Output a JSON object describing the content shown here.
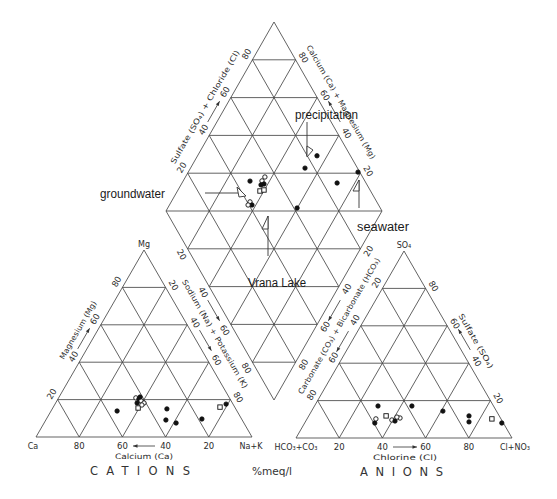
{
  "chart_data": {
    "type": "scatter",
    "variant": "piper-trilinear",
    "title": "",
    "units_label": "%meq/l",
    "grid": true,
    "grid_interval_percent": 20,
    "marker_types": [
      "filled",
      "open-circle",
      "open-square"
    ],
    "cations": {
      "title": "CATIONS",
      "vertex_labels": {
        "bottom_left": "Ca",
        "bottom_right": "Na+K",
        "top": "Mg"
      },
      "axes": {
        "calcium": {
          "label": "Calcium (Ca)",
          "ticks": [
            "80",
            "60",
            "40",
            "20"
          ]
        },
        "magnesium": {
          "label": "Magnesium (Mg)",
          "ticks": [
            "20",
            "40",
            "60",
            "80"
          ]
        },
        "sodium_potassium": {
          "label": "Sodium (Na) + Potassium (K)",
          "ticks": [
            "20",
            "40",
            "60",
            "80"
          ]
        }
      },
      "points": [
        {
          "ca": 43.3,
          "mg": 20.9,
          "nak": 35.8,
          "marker": "open-circle"
        },
        {
          "ca": 42.2,
          "mg": 20.3,
          "nak": 37.5,
          "marker": "filled"
        },
        {
          "ca": 41.7,
          "mg": 19.3,
          "nak": 39.0,
          "marker": "open-circle"
        },
        {
          "ca": 40.9,
          "mg": 18.2,
          "nak": 40.9,
          "marker": "open-circle"
        },
        {
          "ca": 44.1,
          "mg": 18.2,
          "nak": 37.7,
          "marker": "filled"
        },
        {
          "ca": 41.1,
          "mg": 21.4,
          "nak": 37.5,
          "marker": "filled"
        },
        {
          "ca": 45.0,
          "mg": 15.5,
          "nak": 39.5,
          "marker": "open-square"
        },
        {
          "ca": 42.4,
          "mg": 17.1,
          "nak": 40.5,
          "marker": "open-circle"
        },
        {
          "ca": 55.5,
          "mg": 13.9,
          "nak": 30.6,
          "marker": "filled"
        },
        {
          "ca": 31.9,
          "mg": 15.0,
          "nak": 53.1,
          "marker": "filled"
        },
        {
          "ca": 35.3,
          "mg": 9.1,
          "nak": 55.6,
          "marker": "filled"
        },
        {
          "ca": 31.4,
          "mg": 7.5,
          "nak": 61.1,
          "marker": "filled"
        },
        {
          "ca": 18.4,
          "mg": 9.6,
          "nak": 72.0,
          "marker": "filled"
        },
        {
          "ca": 3.2,
          "mg": 17.6,
          "nak": 79.2,
          "marker": "filled"
        },
        {
          "ca": 6.8,
          "mg": 16.0,
          "nak": 77.2,
          "marker": "open-square"
        }
      ]
    },
    "anions": {
      "title": "ANIONS",
      "vertex_labels": {
        "bottom_left": "HCO₃+CO₃",
        "bottom_right": "Cl+NO₃",
        "top": "SO₄"
      },
      "axes": {
        "chloride": {
          "label": "Chlorine (Cl)",
          "ticks": [
            "20",
            "40",
            "60",
            "80"
          ]
        },
        "sulfate": {
          "label": "Sulfate (SO₄)",
          "ticks": [
            "20",
            "40",
            "60",
            "80"
          ]
        },
        "carbonate_bicarbonate": {
          "label": "Carbonate (CO₃) + Bicarbonate (HCO₃)",
          "ticks": [
            "20",
            "40",
            "60",
            "80"
          ]
        }
      },
      "points": [
        {
          "hco3_co3": 53.5,
          "so4": 17.1,
          "cl_no3": 29.4,
          "marker": "filled"
        },
        {
          "hco3_co3": 37.8,
          "so4": 17.1,
          "cl_no3": 45.1,
          "marker": "filled"
        },
        {
          "hco3_co3": 24.8,
          "so4": 14.4,
          "cl_no3": 60.8,
          "marker": "filled"
        },
        {
          "hco3_co3": 14.0,
          "so4": 11.8,
          "cl_no3": 74.2,
          "marker": "filled"
        },
        {
          "hco3_co3": 15.6,
          "so4": 8.6,
          "cl_no3": 75.8,
          "marker": "filled"
        },
        {
          "hco3_co3": 4.2,
          "so4": 10.2,
          "cl_no3": 85.6,
          "marker": "open-square"
        },
        {
          "hco3_co3": 0.7,
          "so4": 8.0,
          "cl_no3": 91.3,
          "marker": "filled"
        },
        {
          "hco3_co3": 59.5,
          "so4": 8.0,
          "cl_no3": 32.5,
          "marker": "filled"
        },
        {
          "hco3_co3": 57.9,
          "so4": 10.2,
          "cl_no3": 31.9,
          "marker": "open-circle"
        },
        {
          "hco3_co3": 52.4,
          "so4": 11.8,
          "cl_no3": 35.8,
          "marker": "open-square"
        },
        {
          "hco3_co3": 50.8,
          "so4": 9.6,
          "cl_no3": 39.6,
          "marker": "open-circle"
        },
        {
          "hco3_co3": 49.6,
          "so4": 9.1,
          "cl_no3": 41.3,
          "marker": "filled"
        },
        {
          "hco3_co3": 46.5,
          "so4": 10.7,
          "cl_no3": 42.8,
          "marker": "open-circle"
        },
        {
          "hco3_co3": 47.7,
          "so4": 11.2,
          "cl_no3": 41.1,
          "marker": "open-circle"
        }
      ]
    },
    "diamond": {
      "axes": {
        "sulfate_chloride": {
          "label": "Sulfate (SO₄) + Chloride (Cl)",
          "ticks": [
            "20",
            "40",
            "60",
            "80"
          ]
        },
        "calcium_magnesium": {
          "label": "Calcium (Ca) + Magnesium (Mg)",
          "ticks": [
            "20",
            "40",
            "60",
            "80"
          ]
        },
        "sodium_potassium": {
          "ticks": [
            "20",
            "40",
            "60",
            "80"
          ]
        },
        "carbonate_bicarbonate": {
          "ticks": [
            "20",
            "40",
            "60",
            "80"
          ]
        }
      },
      "points": [
        {
          "ca_mg": 69.0,
          "so4_cl": 46.8,
          "marker": "filled"
        },
        {
          "ca_mg": 63.5,
          "so4_cl": 52.4,
          "marker": "open-circle"
        },
        {
          "ca_mg": 61.8,
          "so4_cl": 52.5,
          "marker": "filled"
        },
        {
          "ca_mg": 62.9,
          "so4_cl": 50.9,
          "marker": "filled"
        },
        {
          "ca_mg": 63.2,
          "so4_cl": 54.8,
          "marker": "open-circle"
        },
        {
          "ca_mg": 61.8,
          "so4_cl": 48.8,
          "marker": "open-square"
        },
        {
          "ca_mg": 60.2,
          "so4_cl": 50.9,
          "marker": "open-square"
        },
        {
          "ca_mg": 63.5,
          "so4_cl": 41.3,
          "marker": "open-circle"
        },
        {
          "ca_mg": 61.8,
          "so4_cl": 41.4,
          "marker": "filled"
        },
        {
          "ca_mg": 63.6,
          "so4_cl": 39.6,
          "marker": "open-circle"
        },
        {
          "ca_mg": 40.1,
          "so4_cl": 61.5,
          "marker": "filled"
        },
        {
          "ca_mg": 44.7,
          "so4_cl": 84.5,
          "marker": "filled"
        },
        {
          "ca_mg": 47.0,
          "so4_cl": 75.7,
          "marker": "filled"
        },
        {
          "ca_mg": 21.4,
          "so4_cl": 99.2,
          "marker": "filled"
        },
        {
          "ca_mg": 28.2,
          "so4_cl": 86.6,
          "marker": "filled"
        }
      ]
    },
    "annotations": [
      {
        "text": "precipitation"
      },
      {
        "text": "groundwater"
      },
      {
        "text": "seawater"
      },
      {
        "text": "Vrana Lake"
      }
    ]
  }
}
